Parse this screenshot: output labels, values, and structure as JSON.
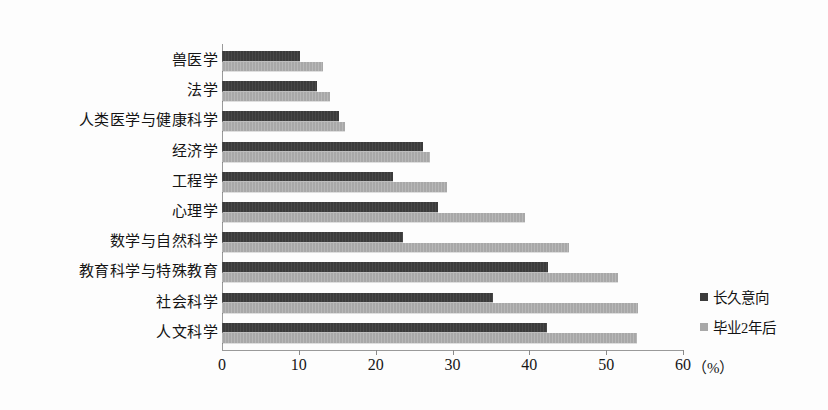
{
  "chart_data": {
    "type": "bar",
    "orientation": "horizontal",
    "title": "",
    "xlabel": "（%）",
    "ylabel": "",
    "xlim": [
      0,
      60
    ],
    "xticks": [
      0,
      10,
      20,
      30,
      40,
      50,
      60
    ],
    "xtick_labels": [
      "0",
      "10",
      "20",
      "30",
      "40",
      "50",
      "60"
    ],
    "grid": false,
    "legend_position": "right",
    "categories": [
      "兽医学",
      "法学",
      "人类医学与健康科学",
      "经济学",
      "工程学",
      "心理学",
      "数学与自然科学",
      "教育科学与特殊教育",
      "社会科学",
      "人文科学"
    ],
    "series": [
      {
        "name": "长久意向",
        "color": "#3b3b3b",
        "values": [
          10.2,
          12.4,
          15.2,
          26.2,
          22.3,
          28.1,
          23.6,
          42.4,
          35.3,
          42.3
        ]
      },
      {
        "name": "毕业2年后",
        "color": "#a8a8a8",
        "values": [
          13.2,
          14.1,
          16.0,
          27.1,
          29.3,
          39.5,
          45.1,
          51.5,
          54.2,
          54.0
        ]
      }
    ]
  },
  "axis": {
    "unit_label": "（%）"
  }
}
